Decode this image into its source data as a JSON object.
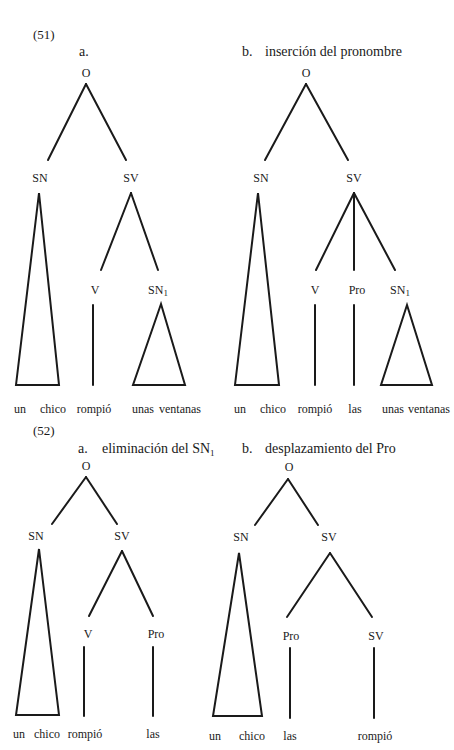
{
  "example_51": {
    "number": "(51)",
    "a": {
      "letter": "a.",
      "title": "",
      "nodes": {
        "root": "O",
        "sn": "SN",
        "sv": "SV",
        "v": "V",
        "sn1": "SN",
        "sn1_sub": "1"
      },
      "words": [
        "un",
        "chico",
        "rompió",
        "unas",
        "ventanas"
      ]
    },
    "b": {
      "letter": "b.",
      "title": "inserción del pronombre",
      "nodes": {
        "root": "O",
        "sn": "SN",
        "sv": "SV",
        "v": "V",
        "pro": "Pro",
        "sn1": "SN",
        "sn1_sub": "1"
      },
      "words": [
        "un",
        "chico",
        "rompió",
        "las",
        "unas",
        "ventanas"
      ]
    }
  },
  "example_52": {
    "number": "(52)",
    "a": {
      "letter": "a.",
      "title": "eliminación del SN",
      "title_sub": "1",
      "nodes": {
        "root": "O",
        "sn": "SN",
        "sv": "SV",
        "v": "V",
        "pro": "Pro"
      },
      "words": [
        "un",
        "chico",
        "rompió",
        "las"
      ]
    },
    "b": {
      "letter": "b.",
      "title": "desplazamiento del Pro",
      "nodes": {
        "root": "O",
        "sn": "SN",
        "sv": "SV",
        "pro": "Pro",
        "sv2": "SV"
      },
      "words": [
        "un",
        "chico",
        "las",
        "rompió"
      ]
    }
  }
}
